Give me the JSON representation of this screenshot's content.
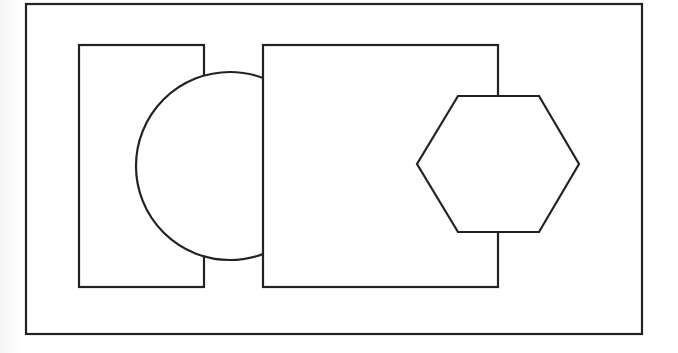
{
  "diagram": {
    "canvas": {
      "width": 678,
      "height": 353,
      "background": "#ffffff",
      "stroke": "#222222"
    },
    "shapes": [
      {
        "id": "outer-frame",
        "type": "rectangle",
        "x": 26,
        "y": 4,
        "width": 616,
        "height": 330
      },
      {
        "id": "left-rect",
        "type": "rectangle",
        "x": 79,
        "y": 45,
        "width": 125,
        "height": 242
      },
      {
        "id": "circle",
        "type": "circle",
        "cx": 230,
        "cy": 166,
        "r": 94
      },
      {
        "id": "middle-rect",
        "type": "rectangle",
        "x": 263,
        "y": 45,
        "width": 235,
        "height": 242
      },
      {
        "id": "hexagon",
        "type": "polygon",
        "points": [
          [
            458,
            96
          ],
          [
            539,
            96
          ],
          [
            579,
            164
          ],
          [
            539,
            232
          ],
          [
            458,
            232
          ],
          [
            417,
            164
          ]
        ]
      }
    ],
    "labels": []
  }
}
